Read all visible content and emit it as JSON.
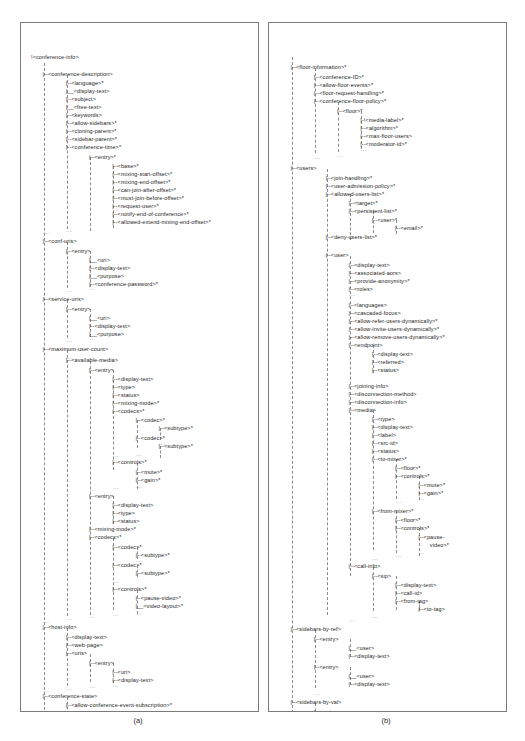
{
  "figure": {
    "panels": [
      {
        "id": "a",
        "label": "(a)",
        "caption_text": "(a)"
      },
      {
        "id": "b",
        "label": "(b)",
        "caption_text": "(b)"
      }
    ],
    "ellipsis_glyph": "...",
    "elbow_glyph": "|--",
    "elbow_last_glyph": "|__"
  },
  "panel_a": {
    "name": "conference-info-tree",
    "nodes": [
      {
        "text": "!<conference-info>",
        "depth": 0,
        "y": 31
      },
      {
        "text": "|--<conference-description>",
        "depth": 1,
        "y": 48
      },
      {
        "text": "|--<language>*",
        "depth": 3,
        "y": 57
      },
      {
        "text": "|__<display-text>",
        "depth": 3,
        "y": 65
      },
      {
        "text": "|--<subject>",
        "depth": 3,
        "y": 73
      },
      {
        "text": "|__<free-text>",
        "depth": 3,
        "y": 81
      },
      {
        "text": "|--<keywords>",
        "depth": 3,
        "y": 89
      },
      {
        "text": "|--<allow-sidebars>*",
        "depth": 3,
        "y": 97
      },
      {
        "text": "|--<cloning-parent>*",
        "depth": 3,
        "y": 105
      },
      {
        "text": "|--<sidebar-parent>*",
        "depth": 3,
        "y": 113
      },
      {
        "text": "|--<conference-time>*",
        "depth": 3,
        "y": 121
      },
      {
        "text": "|--<entry>*",
        "depth": 5,
        "y": 131
      },
      {
        "text": "|--<base>*",
        "depth": 7,
        "y": 140
      },
      {
        "text": "|--<mixing-start-offset>*",
        "depth": 7,
        "y": 148
      },
      {
        "text": "|--<mixing-end-offset>*",
        "depth": 7,
        "y": 156
      },
      {
        "text": "|--<can-join-after-offset>*",
        "depth": 7,
        "y": 164
      },
      {
        "text": "|--<must-join-before-offset>*",
        "depth": 7,
        "y": 172
      },
      {
        "text": "|--<request-user>*",
        "depth": 7,
        "y": 180
      },
      {
        "text": "|--<notify-end-of-conference>*",
        "depth": 7,
        "y": 188
      },
      {
        "text": "|--<allowed-extend-mixing-end-offset>*",
        "depth": 7,
        "y": 196
      },
      {
        "text": "|--<conf-uris>",
        "depth": 1,
        "y": 215
      },
      {
        "text": "|--<entry>",
        "depth": 3,
        "y": 225
      },
      {
        "text": "|__<uri>",
        "depth": 5,
        "y": 234
      },
      {
        "text": "|--<display-text>",
        "depth": 5,
        "y": 242
      },
      {
        "text": "|__<purpose>",
        "depth": 5,
        "y": 250
      },
      {
        "text": "|--<conference-password>*",
        "depth": 5,
        "y": 258
      },
      {
        "text": "|--<service-uris>",
        "depth": 1,
        "y": 273
      },
      {
        "text": "|--<entry>",
        "depth": 3,
        "y": 283
      },
      {
        "text": "|__<uri>",
        "depth": 5,
        "y": 292
      },
      {
        "text": "|--<display-text>",
        "depth": 5,
        "y": 300
      },
      {
        "text": "|__<purpose>",
        "depth": 5,
        "y": 308
      },
      {
        "text": "|--<maximum-user-count>",
        "depth": 1,
        "y": 323
      },
      {
        "text": "|--<available-media>",
        "depth": 3,
        "y": 334
      },
      {
        "text": "|--<entry>",
        "depth": 5,
        "y": 344
      },
      {
        "text": "|--<display-text>",
        "depth": 7,
        "y": 353
      },
      {
        "text": "|--<type>",
        "depth": 7,
        "y": 361
      },
      {
        "text": "|--<status>",
        "depth": 7,
        "y": 369
      },
      {
        "text": "|--<mixing-mode>*",
        "depth": 7,
        "y": 377
      },
      {
        "text": "|--<codecs>*",
        "depth": 7,
        "y": 385
      },
      {
        "text": "|--<codec>*",
        "depth": 9,
        "y": 394
      },
      {
        "text": "|--<subtype>*",
        "depth": 11,
        "y": 402
      },
      {
        "text": "|--<codec>*",
        "depth": 9,
        "y": 412
      },
      {
        "text": "|--<subtype>*",
        "depth": 11,
        "y": 420
      },
      {
        "text": "|--<controls>*",
        "depth": 7,
        "y": 436
      },
      {
        "text": "|--<mute>*",
        "depth": 9,
        "y": 446
      },
      {
        "text": "|--<gain>*",
        "depth": 9,
        "y": 454
      },
      {
        "text": "|--<entry>",
        "depth": 5,
        "y": 470
      },
      {
        "text": "|--<display-text>",
        "depth": 7,
        "y": 479
      },
      {
        "text": "|--<type>",
        "depth": 7,
        "y": 487
      },
      {
        "text": "|--<status>",
        "depth": 7,
        "y": 495
      },
      {
        "text": "|--<mixing-mode>*",
        "depth": 5,
        "y": 503
      },
      {
        "text": "|--<codecs>*",
        "depth": 5,
        "y": 511
      },
      {
        "text": "|--<codec>*",
        "depth": 7,
        "y": 521
      },
      {
        "text": "|--<subtype>*",
        "depth": 9,
        "y": 529
      },
      {
        "text": "|--<codec>*",
        "depth": 7,
        "y": 539
      },
      {
        "text": "|--<subtype>*",
        "depth": 9,
        "y": 547
      },
      {
        "text": "|--<controls>*",
        "depth": 7,
        "y": 563
      },
      {
        "text": "|--<pause-video>*",
        "depth": 9,
        "y": 572
      },
      {
        "text": "|__<video-layout>*",
        "depth": 9,
        "y": 580
      },
      {
        "text": "|--<host-info>",
        "depth": 1,
        "y": 601
      },
      {
        "text": "|--<display-text>",
        "depth": 3,
        "y": 611
      },
      {
        "text": "|--<web-page>",
        "depth": 3,
        "y": 619
      },
      {
        "text": "|--<uris>",
        "depth": 3,
        "y": 627
      },
      {
        "text": "|--<entry>",
        "depth": 5,
        "y": 637
      },
      {
        "text": "|--<uri>",
        "depth": 7,
        "y": 646
      },
      {
        "text": "|--<display-text>",
        "depth": 7,
        "y": 654
      },
      {
        "text": "|--<conference-state>",
        "depth": 1,
        "y": 670
      },
      {
        "text": "|--<allow-conference-event-subscription>*",
        "depth": 3,
        "y": 679
      },
      {
        "text": "|--<user-count>",
        "depth": 3,
        "y": 687
      },
      {
        "text": "|--<active>",
        "depth": 3,
        "y": 695
      },
      {
        "text": "|--<locked>",
        "depth": 3,
        "y": 703
      }
    ],
    "rails": [
      {
        "depth": 1,
        "y": 40,
        "h": 672
      },
      {
        "depth": 3,
        "y": 52,
        "h": 154
      },
      {
        "depth": 5,
        "y": 134,
        "h": 74
      },
      {
        "depth": 7,
        "y": 143,
        "h": 62
      },
      {
        "depth": 3,
        "y": 219,
        "h": 46
      },
      {
        "depth": 5,
        "y": 228,
        "h": 36
      },
      {
        "depth": 3,
        "y": 277,
        "h": 38
      },
      {
        "depth": 5,
        "y": 286,
        "h": 28
      },
      {
        "depth": 3,
        "y": 327,
        "h": 266
      },
      {
        "depth": 5,
        "y": 338,
        "h": 254
      },
      {
        "depth": 7,
        "y": 347,
        "h": 100
      },
      {
        "depth": 9,
        "y": 397,
        "h": 28
      },
      {
        "depth": 11,
        "y": 405,
        "h": 12
      },
      {
        "depth": 11,
        "y": 423,
        "h": 12
      },
      {
        "depth": 9,
        "y": 440,
        "h": 26
      },
      {
        "depth": 7,
        "y": 473,
        "h": 28
      },
      {
        "depth": 7,
        "y": 515,
        "h": 72
      },
      {
        "depth": 9,
        "y": 524,
        "h": 12
      },
      {
        "depth": 9,
        "y": 542,
        "h": 12
      },
      {
        "depth": 9,
        "y": 567,
        "h": 24
      },
      {
        "depth": 3,
        "y": 605,
        "h": 58
      },
      {
        "depth": 5,
        "y": 631,
        "h": 28
      },
      {
        "depth": 7,
        "y": 640,
        "h": 20
      },
      {
        "depth": 3,
        "y": 674,
        "h": 36
      }
    ],
    "ellipsis_marks": [
      {
        "depth": 3,
        "y": 205
      },
      {
        "depth": 1,
        "y": 207
      },
      {
        "depth": 5,
        "y": 263
      },
      {
        "depth": 3,
        "y": 265
      },
      {
        "depth": 5,
        "y": 313
      },
      {
        "depth": 3,
        "y": 315
      },
      {
        "depth": 11,
        "y": 418
      },
      {
        "depth": 9,
        "y": 429
      },
      {
        "depth": 7,
        "y": 430
      },
      {
        "depth": 9,
        "y": 461
      },
      {
        "depth": 7,
        "y": 462
      },
      {
        "depth": 5,
        "y": 464
      },
      {
        "depth": 3,
        "y": 332
      },
      {
        "depth": 9,
        "y": 535
      },
      {
        "depth": 7,
        "y": 556
      },
      {
        "depth": 9,
        "y": 588
      },
      {
        "depth": 7,
        "y": 589
      },
      {
        "depth": 5,
        "y": 591
      },
      {
        "depth": 3,
        "y": 593
      },
      {
        "depth": 1,
        "y": 596
      },
      {
        "depth": 7,
        "y": 660
      },
      {
        "depth": 5,
        "y": 661
      },
      {
        "depth": 3,
        "y": 663
      },
      {
        "depth": 1,
        "y": 665
      },
      {
        "depth": 3,
        "y": 709
      }
    ]
  },
  "panel_b": {
    "name": "floor-information-and-users-tree",
    "nodes": [
      {
        "text": "|--<floor-information>*",
        "depth": 1,
        "y": 41
      },
      {
        "text": "|--<conference-ID>*",
        "depth": 3,
        "y": 51
      },
      {
        "text": "|--<allow-floor-events>*",
        "depth": 3,
        "y": 59
      },
      {
        "text": "|--<floor-request-handling>*",
        "depth": 3,
        "y": 67
      },
      {
        "text": "|--<conference-floor-policy>*",
        "depth": 3,
        "y": 75
      },
      {
        "text": "|--<floor>*",
        "depth": 5,
        "y": 85
      },
      {
        "text": "|-!<media-label>*",
        "depth": 7,
        "y": 94
      },
      {
        "text": "|--<algorithm>*",
        "depth": 7,
        "y": 102
      },
      {
        "text": "|--<max-floor-users>",
        "depth": 7,
        "y": 110
      },
      {
        "text": "|--<moderator-id>*",
        "depth": 7,
        "y": 118
      },
      {
        "text": "|--<users>",
        "depth": 1,
        "y": 142
      },
      {
        "text": "|--<join-handling>*",
        "depth": 4,
        "y": 152
      },
      {
        "text": "|--<user-admission-policy>*",
        "depth": 4,
        "y": 160
      },
      {
        "text": "|--<allowed-users-list>*",
        "depth": 4,
        "y": 168
      },
      {
        "text": "|--<target>*",
        "depth": 6,
        "y": 177
      },
      {
        "text": "|--<persistent-list>*",
        "depth": 6,
        "y": 185
      },
      {
        "text": "|--<user>*",
        "depth": 8,
        "y": 194
      },
      {
        "text": "|--<email>*",
        "depth": 10,
        "y": 202
      },
      {
        "text": "|--<deny-users-list>*",
        "depth": 4,
        "y": 211
      },
      {
        "text": "|--<user>",
        "depth": 4,
        "y": 229
      },
      {
        "text": "|--<display-text>",
        "depth": 6,
        "y": 239
      },
      {
        "text": "|--<associated-aors>",
        "depth": 6,
        "y": 247
      },
      {
        "text": "|--<provide-anonymity>*",
        "depth": 6,
        "y": 255
      },
      {
        "text": "|--<roles>",
        "depth": 6,
        "y": 263
      },
      {
        "text": "|--<languages>",
        "depth": 6,
        "y": 279
      },
      {
        "text": "|--<cascaded-focus>",
        "depth": 6,
        "y": 287
      },
      {
        "text": "|--<allow-refer-users-dynamically>*",
        "depth": 6,
        "y": 295
      },
      {
        "text": "|--<allow-invite-users-dynamically>*",
        "depth": 6,
        "y": 303
      },
      {
        "text": "|--<allow-remove-users-dynamically>*",
        "depth": 6,
        "y": 311
      },
      {
        "text": "|--<endpoint>",
        "depth": 6,
        "y": 319
      },
      {
        "text": "|--<display-text>",
        "depth": 8,
        "y": 328
      },
      {
        "text": "|--<referred>",
        "depth": 8,
        "y": 336
      },
      {
        "text": "|--<status>",
        "depth": 8,
        "y": 344
      },
      {
        "text": "|--<joining-info>",
        "depth": 6,
        "y": 360
      },
      {
        "text": "|--<disconnection-method>",
        "depth": 6,
        "y": 368
      },
      {
        "text": "|--<disconnection-info>",
        "depth": 6,
        "y": 376
      },
      {
        "text": "|--<media>",
        "depth": 6,
        "y": 384
      },
      {
        "text": "|--<type>",
        "depth": 8,
        "y": 393
      },
      {
        "text": "|--<display-text>",
        "depth": 8,
        "y": 401
      },
      {
        "text": "|--<label>",
        "depth": 8,
        "y": 409
      },
      {
        "text": "|--<src-id>",
        "depth": 8,
        "y": 417
      },
      {
        "text": "|--<status>",
        "depth": 8,
        "y": 425
      },
      {
        "text": "|--<to-mixer>*",
        "depth": 8,
        "y": 433
      },
      {
        "text": "|--<floor>*",
        "depth": 10,
        "y": 442
      },
      {
        "text": "|--<controls>*",
        "depth": 10,
        "y": 450
      },
      {
        "text": "|--<mute>*",
        "depth": 12,
        "y": 459
      },
      {
        "text": "|--<gain>*",
        "depth": 12,
        "y": 467
      },
      {
        "text": "|--<from-mixer>*",
        "depth": 8,
        "y": 485
      },
      {
        "text": "|--<floor>*",
        "depth": 10,
        "y": 494
      },
      {
        "text": "|--<controls>*",
        "depth": 10,
        "y": 502
      },
      {
        "text": "|--<pause-",
        "depth": 12,
        "y": 511
      },
      {
        "text": "video>*",
        "depth": 13,
        "y": 519
      },
      {
        "text": "|--<call-info>",
        "depth": 6,
        "y": 540
      },
      {
        "text": "|--<sip>",
        "depth": 8,
        "y": 550
      },
      {
        "text": "|--<display-text>",
        "depth": 10,
        "y": 559
      },
      {
        "text": "|--<call-id>",
        "depth": 10,
        "y": 567
      },
      {
        "text": "|--<from-tag>",
        "depth": 10,
        "y": 575
      },
      {
        "text": "|--<to-tag>",
        "depth": 12,
        "y": 583
      },
      {
        "text": "|--<sidebars-by-ref>",
        "depth": 1,
        "y": 603
      },
      {
        "text": "|--<entry>",
        "depth": 3,
        "y": 613
      },
      {
        "text": "|__<user>",
        "depth": 6,
        "y": 622
      },
      {
        "text": "|--<display-text>",
        "depth": 6,
        "y": 630
      },
      {
        "text": "|--<entry>",
        "depth": 3,
        "y": 641
      },
      {
        "text": "|__<user>",
        "depth": 6,
        "y": 650
      },
      {
        "text": "|--<display-text>",
        "depth": 6,
        "y": 658
      },
      {
        "text": "|--<sidebars-by-val>",
        "depth": 1,
        "y": 676
      },
      {
        "text": "|--<entry>",
        "depth": 3,
        "y": 686
      },
      {
        "text": "|--<entry>",
        "depth": 3,
        "y": 701
      }
    ],
    "rails": [
      {
        "depth": 1,
        "y": 34,
        "h": 676
      },
      {
        "depth": 3,
        "y": 45,
        "h": 85
      },
      {
        "depth": 5,
        "y": 79,
        "h": 50
      },
      {
        "depth": 7,
        "y": 88,
        "h": 38
      },
      {
        "depth": 4,
        "y": 146,
        "h": 446
      },
      {
        "depth": 6,
        "y": 171,
        "h": 46
      },
      {
        "depth": 8,
        "y": 188,
        "h": 22
      },
      {
        "depth": 10,
        "y": 197,
        "h": 14
      },
      {
        "depth": 6,
        "y": 233,
        "h": 320
      },
      {
        "depth": 8,
        "y": 322,
        "h": 28
      },
      {
        "depth": 8,
        "y": 387,
        "h": 140
      },
      {
        "depth": 10,
        "y": 436,
        "h": 40
      },
      {
        "depth": 12,
        "y": 453,
        "h": 24
      },
      {
        "depth": 10,
        "y": 488,
        "h": 42
      },
      {
        "depth": 12,
        "y": 505,
        "h": 28
      },
      {
        "depth": 8,
        "y": 544,
        "h": 44
      },
      {
        "depth": 10,
        "y": 553,
        "h": 34
      },
      {
        "depth": 12,
        "y": 578,
        "h": 10
      },
      {
        "depth": 3,
        "y": 607,
        "h": 58
      },
      {
        "depth": 6,
        "y": 616,
        "h": 18
      },
      {
        "depth": 6,
        "y": 644,
        "h": 18
      },
      {
        "depth": 3,
        "y": 680,
        "h": 30
      }
    ],
    "ellipsis_marks": [
      {
        "depth": 7,
        "y": 124
      },
      {
        "depth": 5,
        "y": 130
      },
      {
        "depth": 3,
        "y": 132
      },
      {
        "depth": 6,
        "y": 269
      },
      {
        "depth": 12,
        "y": 473
      },
      {
        "depth": 10,
        "y": 476
      },
      {
        "depth": 12,
        "y": 527
      },
      {
        "depth": 10,
        "y": 530
      },
      {
        "depth": 8,
        "y": 533
      },
      {
        "depth": 8,
        "y": 591
      },
      {
        "depth": 6,
        "y": 594
      },
      {
        "depth": 3,
        "y": 668
      },
      {
        "depth": 3,
        "y": 693
      },
      {
        "depth": 3,
        "y": 707
      }
    ]
  }
}
